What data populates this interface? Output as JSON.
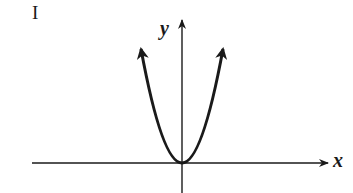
{
  "figure": {
    "panel_label": "I",
    "x_axis_label": "x",
    "y_axis_label": "y"
  },
  "colors": {
    "stroke": "#1a1a1a",
    "background": "#ffffff"
  }
}
